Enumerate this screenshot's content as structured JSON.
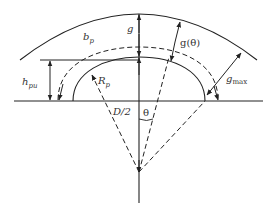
{
  "diagram": {
    "type": "salient pole air-gap geometry",
    "colors": {
      "line": "#222222",
      "text": "#333333",
      "background": "#ffffff"
    },
    "labels": {
      "g": "g",
      "g_theta": "g(θ)",
      "b_p": "b",
      "b_p_sub": "p",
      "h_pu": "h",
      "h_pu_sub": "pu",
      "R_p": "R",
      "R_p_sub": "p",
      "D_half": "D/2",
      "theta": "θ",
      "g_max": "g",
      "g_max_sub": "max"
    },
    "elements": [
      {
        "name": "stator-bore-arc",
        "style": "solid"
      },
      {
        "name": "pole-shoe-profile",
        "style": "solid"
      },
      {
        "name": "pole-arc-outline",
        "style": "dashed"
      },
      {
        "name": "baseline",
        "style": "solid"
      },
      {
        "name": "center-axis",
        "style": "solid"
      },
      {
        "name": "radial-rays",
        "style": "dashed"
      }
    ]
  }
}
